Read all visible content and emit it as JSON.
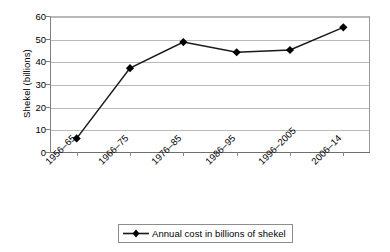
{
  "chart_data": {
    "type": "line",
    "title": "",
    "subtitle": "",
    "xlabel": "",
    "ylabel": "Shekel (billions)",
    "categories": [
      "1956–65",
      "1966–75",
      "1976–85",
      "1986–95",
      "1996–2005",
      "2006–14"
    ],
    "values": [
      6,
      37,
      48.5,
      44,
      45,
      55
    ],
    "series": [
      {
        "name": "Annual cost in billions of shekel",
        "values": [
          6,
          37,
          48.5,
          44,
          45,
          55
        ]
      }
    ],
    "ylim": [
      0,
      60
    ],
    "yticks": [
      0,
      10,
      20,
      30,
      40,
      50,
      60
    ],
    "ytick_labels": [
      "0",
      "10",
      "20",
      "30",
      "40",
      "50",
      "60"
    ],
    "grid": "horizontal",
    "legend_position": "bottom",
    "marker": "diamond",
    "line_color": "#1a1a1a",
    "marker_color": "#000000",
    "gridline_color": "#b9b9b9"
  },
  "axes": {
    "y_title": "Shekel (billions)",
    "y_tick_labels": [
      "60",
      "50",
      "40",
      "30",
      "20",
      "10",
      "0"
    ],
    "x_tick_labels": [
      "1956–65",
      "1966–75",
      "1976–85",
      "1986–95",
      "1996–2005",
      "2006–14"
    ]
  },
  "legend": {
    "entries": [
      {
        "label": "Annual cost in billions of shekel",
        "marker": "diamond-line"
      }
    ]
  }
}
